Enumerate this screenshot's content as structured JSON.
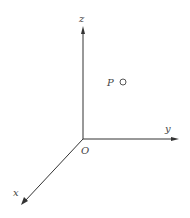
{
  "diagram": {
    "type": "3d-coordinate-axes",
    "origin_label": "O",
    "axes": [
      {
        "name": "x",
        "label": "x",
        "direction": "down-left"
      },
      {
        "name": "y",
        "label": "y",
        "direction": "right"
      },
      {
        "name": "z",
        "label": "z",
        "direction": "up"
      }
    ],
    "points": [
      {
        "label": "P",
        "marker": "open-circle"
      }
    ],
    "colors": {
      "axis": "#333333",
      "label": "#444444",
      "background": "#ffffff"
    }
  }
}
